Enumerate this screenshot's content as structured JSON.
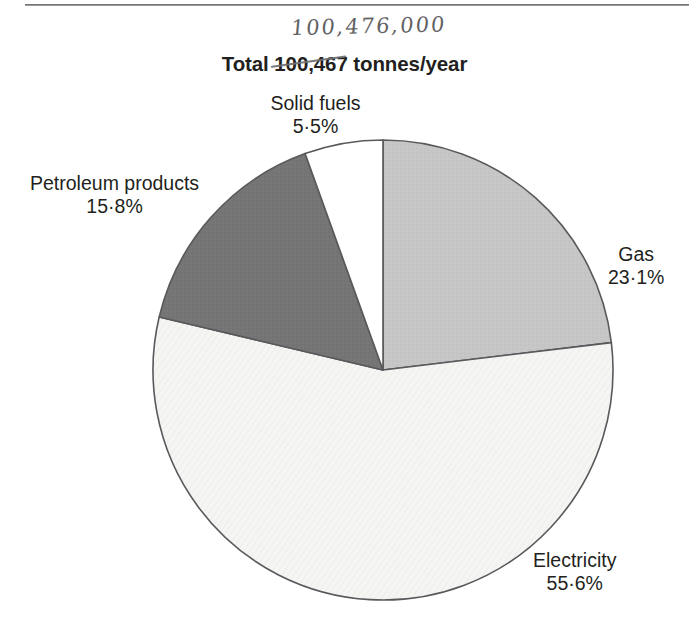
{
  "figure": {
    "title_prefix": "Total ",
    "title_value": "100,467",
    "title_suffix": " tonnes/year",
    "handwritten_correction": "100,476,000",
    "top_rule": "horizontal-rule"
  },
  "chart_data": {
    "type": "pie",
    "title": "Total 100,467 tonnes/year",
    "xlabel": "",
    "ylabel": "",
    "unit": "tonnes/year",
    "total_printed": 100467,
    "total_handwritten": 100476000,
    "legend_position": "callout-labels",
    "grid": false,
    "start_angle_deg": 0,
    "direction": "clockwise",
    "categories": [
      "Gas",
      "Electricity",
      "Petroleum products",
      "Solid fuels"
    ],
    "values": [
      23.1,
      55.6,
      15.8,
      5.5
    ],
    "slices": [
      {
        "name": "Gas",
        "label": "Gas",
        "percent_text": "23·1%",
        "value": 23.1,
        "color": "#c4c4c4",
        "start_deg": 0.0,
        "end_deg": 83.16
      },
      {
        "name": "Electricity",
        "label": "Electricity",
        "percent_text": "55·6%",
        "value": 55.6,
        "color": "#f4f4f2",
        "start_deg": 83.16,
        "end_deg": 283.32
      },
      {
        "name": "Petroleum products",
        "label": "Petroleum products",
        "percent_text": "15·8%",
        "value": 15.8,
        "color": "#737373",
        "start_deg": 283.32,
        "end_deg": 340.2
      },
      {
        "name": "Solid fuels",
        "label": "Solid fuels",
        "percent_text": "5·5%",
        "value": 5.5,
        "color": "#ffffff",
        "start_deg": 340.2,
        "end_deg": 360.0
      }
    ],
    "stroke_color": "#58595b"
  },
  "labels": {
    "solid_fuels": {
      "name": "Solid fuels",
      "percent": "5·5%"
    },
    "petroleum": {
      "name": "Petroleum products",
      "percent": "15·8%"
    },
    "gas": {
      "name": "Gas",
      "percent": "23·1%"
    },
    "electricity": {
      "name": "Electricity",
      "percent": "55·6%"
    }
  }
}
